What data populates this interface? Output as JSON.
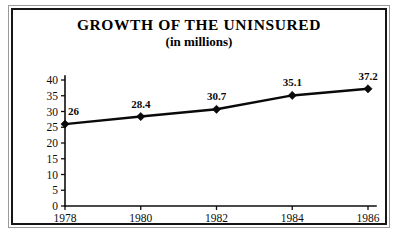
{
  "figure": {
    "title": "GROWTH OF THE UNINSURED",
    "subtitle": "(in millions)",
    "border_color": "#161616",
    "background_color": "#ffffff",
    "ink_color": "#0a0a0a"
  },
  "chart_data": {
    "type": "line",
    "title": "GROWTH OF THE UNINSURED",
    "subtitle": "(in millions)",
    "xlabel": "",
    "ylabel": "",
    "categories": [
      "1978",
      "1980",
      "1982",
      "1984",
      "1986"
    ],
    "x": [
      1978,
      1980,
      1982,
      1984,
      1986
    ],
    "values": [
      26,
      28.4,
      30.7,
      35.1,
      37.2
    ],
    "point_labels": [
      "26",
      "28.4",
      "30.7",
      "35.1",
      "37.2"
    ],
    "ylim": [
      0,
      40
    ],
    "ytick_step": 5,
    "yticks": [
      0,
      5,
      10,
      15,
      20,
      25,
      30,
      35,
      40
    ],
    "ytick_labels": [
      "0",
      "5",
      "10",
      "15",
      "20",
      "25",
      "30",
      "35",
      "40"
    ],
    "xtick_labels": [
      "1978",
      "1980",
      "1982",
      "1984",
      "1986"
    ],
    "grid": false,
    "legend": false,
    "legend_position": "none",
    "marker": "diamond",
    "line_color": "#0a0a0a",
    "marker_color": "#0a0a0a"
  }
}
